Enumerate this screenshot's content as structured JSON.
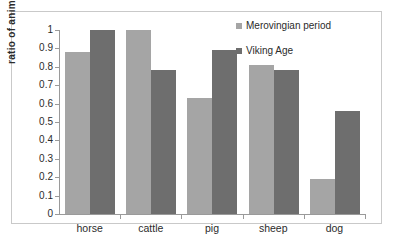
{
  "chart_data": {
    "type": "bar",
    "title": "",
    "xlabel": "",
    "ylabel": "ratio of animals",
    "categories": [
      "horse",
      "cattle",
      "pig",
      "sheep",
      "dog"
    ],
    "series": [
      {
        "name": "Merovingian period",
        "color": "#a5a5a5",
        "values": [
          0.88,
          1.0,
          0.63,
          0.81,
          0.19
        ]
      },
      {
        "name": "Viking Age",
        "color": "#6e6e6e",
        "values": [
          1.0,
          0.78,
          0.89,
          0.78,
          0.56
        ]
      }
    ],
    "ylim": [
      0,
      1
    ],
    "ytick_labels": [
      "1",
      "0.9",
      "0.8",
      "0.7",
      "0.6",
      "0.5",
      "0.4",
      "0.3",
      "0.2",
      "0.1",
      "0"
    ],
    "ytick_values": [
      1,
      0.9,
      0.8,
      0.7,
      0.6,
      0.5,
      0.4,
      0.3,
      0.2,
      0.1,
      0
    ],
    "grid": false,
    "legend_position": "top-right"
  }
}
